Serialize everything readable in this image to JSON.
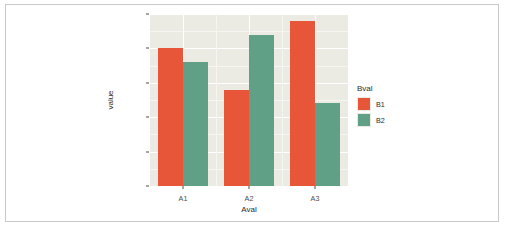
{
  "chart_data": {
    "type": "bar",
    "title": "",
    "subtitle": "",
    "xlabel": "Aval",
    "ylabel": "value",
    "categories": [
      "A1",
      "A2",
      "A3"
    ],
    "series": [
      {
        "name": "B1",
        "color": "#e8563a",
        "values": [
          10,
          7,
          12
        ]
      },
      {
        "name": "B2",
        "color": "#60a087",
        "values": [
          9,
          11,
          6
        ]
      }
    ],
    "legend": {
      "title": "Bval",
      "position": "right",
      "entries": [
        "B1",
        "B2"
      ]
    },
    "ylim": [
      0,
      12.5
    ],
    "y_ticks": [
      "0.0",
      "2.5",
      "5.0",
      "7.5",
      "10.0",
      "12.5"
    ],
    "y_tick_values": [
      0,
      2.5,
      5,
      7.5,
      10,
      12.5
    ],
    "x_ticks": [
      "A1",
      "A2",
      "A3"
    ],
    "grid": true,
    "panel_background": "#ebebe4",
    "grid_color": "#ffffff",
    "figure_background": "#ffffff",
    "bar_mode": "dodge"
  }
}
